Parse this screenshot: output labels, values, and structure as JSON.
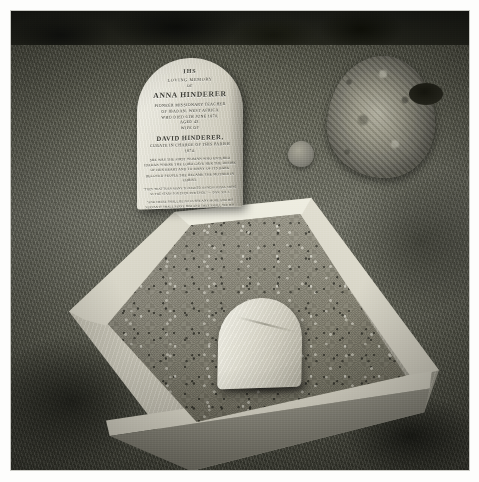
{
  "image": {
    "type": "photograph",
    "medium": "black-and-white photograph",
    "subject": "Grave of Anna and David Hinderer",
    "description": "A black and white photograph of a churchyard grave. A rounded-top headstone bearing a long inscription stands at the head of a stone-kerbed grave filled with gravel chippings. A small rounded white footstone sits within the gravel. Grass surrounds the plot and a weathered, lichen-covered old gravestone stands in the background to the right."
  },
  "headstone": {
    "symbol": "IHS",
    "line_loving_memory": "Loving Memory",
    "line_of": "of",
    "name_primary": "Anna Hinderer",
    "detail_1": "Pioneer Missionary Teacher",
    "detail_2": "of Ibadan, West Africa",
    "detail_3": "Who Died 6th June 1870,",
    "detail_4": "Aged 43.",
    "wife_prefix": "Wife of",
    "name_secondary": "David Hinderer,",
    "detail_5": "Curate in Charge of This Parish",
    "detail_6": "1874.",
    "memorial_block": "She Was The First Woman Who Entered Ibadan Where The Lord Gave Her The Desire Of Her Heart And To Many Of Its Dark Beloved People She Became The Mother In Christ.",
    "verse_1": "\"They That Turn Many To Righteousness Shall Shine As The Stars For Ever And Ever.\" — Dan. XII. 3.",
    "verse_2": "\"And There Shall Be No Curse Any More And His Servants Shall Serve Him And They Shall See His Face And His Name Shall Be On Their Foreheads.\" — Rev. XXII. 3, 4."
  },
  "scene_elements": {
    "headstone_label": "inscribed headstone",
    "footstone_label": "small rounded footstone",
    "kerb_label": "stone grave kerb",
    "gravel_label": "gravel grave bed",
    "grass_label": "churchyard grass",
    "background_stone_label": "weathered lichen-covered gravestone",
    "foliage_label": "dark foliage shadow"
  },
  "colors": {
    "stone_light": "#efeee4",
    "stone_mid": "#cfccbe",
    "stone_dark": "#a2a093",
    "gravel": "#8b8878",
    "grass_light": "#76776a",
    "grass_dark": "#45463a",
    "shadow": "#1b1c17",
    "paper_border": "#fdfdfc"
  }
}
